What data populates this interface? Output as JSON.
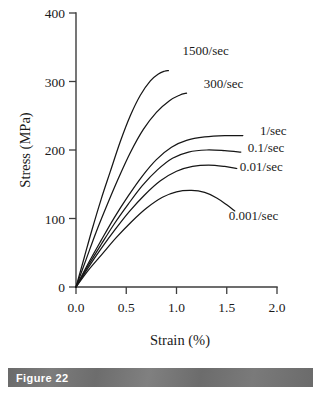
{
  "caption": {
    "label": "Figure 22"
  },
  "chart_data": {
    "type": "line",
    "title": "",
    "xlabel": "Strain (%)",
    "ylabel": "Stress (MPa)",
    "xlim": [
      0.0,
      2.0
    ],
    "ylim": [
      0,
      400
    ],
    "xticks": [
      "0.0",
      "0.5",
      "1.0",
      "1.5",
      "2.0"
    ],
    "xtick_values": [
      0.0,
      0.5,
      1.0,
      1.5,
      2.0
    ],
    "yticks": [
      "0",
      "100",
      "200",
      "300",
      "400"
    ],
    "ytick_values": [
      0,
      100,
      200,
      300,
      400
    ],
    "grid": false,
    "legend_position": "inline-right-of-curve-ends",
    "series": [
      {
        "name": "1500/sec",
        "label": "1500/sec",
        "label_x": 1.06,
        "label_y": 345,
        "x": [
          0.0,
          0.08,
          0.16,
          0.25,
          0.34,
          0.44,
          0.54,
          0.64,
          0.74,
          0.82,
          0.88,
          0.92
        ],
        "y": [
          0,
          42,
          84,
          128,
          168,
          212,
          250,
          280,
          301,
          311,
          315,
          316
        ]
      },
      {
        "name": "300/sec",
        "label": "300/sec",
        "label_x": 1.27,
        "label_y": 297,
        "x": [
          0.0,
          0.1,
          0.2,
          0.31,
          0.42,
          0.54,
          0.67,
          0.8,
          0.93,
          1.03,
          1.1
        ],
        "y": [
          0,
          40,
          80,
          120,
          158,
          196,
          230,
          255,
          272,
          280,
          283
        ]
      },
      {
        "name": "1/sec",
        "label": "1/sec",
        "label_x": 1.83,
        "label_y": 228,
        "x": [
          0.0,
          0.12,
          0.25,
          0.38,
          0.52,
          0.66,
          0.8,
          0.95,
          1.1,
          1.28,
          1.48,
          1.66
        ],
        "y": [
          0,
          34,
          68,
          101,
          133,
          162,
          186,
          204,
          214,
          219,
          221,
          221
        ]
      },
      {
        "name": "0.1/sec",
        "label": "0.1/sec",
        "label_x": 1.71,
        "label_y": 203,
        "x": [
          0.0,
          0.12,
          0.25,
          0.38,
          0.52,
          0.66,
          0.81,
          0.96,
          1.12,
          1.3,
          1.48,
          1.64
        ],
        "y": [
          0,
          31,
          62,
          92,
          121,
          148,
          171,
          188,
          197,
          200,
          199,
          197
        ]
      },
      {
        "name": "0.01/sec",
        "label": "0.01/sec",
        "label_x": 1.63,
        "label_y": 175,
        "x": [
          0.0,
          0.12,
          0.25,
          0.39,
          0.53,
          0.68,
          0.84,
          1.0,
          1.16,
          1.32,
          1.48,
          1.6
        ],
        "y": [
          0,
          28,
          56,
          84,
          110,
          134,
          155,
          169,
          176,
          178,
          176,
          173
        ]
      },
      {
        "name": "0.001/sec",
        "label": "0.001/sec",
        "label_x": 1.52,
        "label_y": 104,
        "x": [
          0.0,
          0.12,
          0.26,
          0.4,
          0.55,
          0.7,
          0.86,
          1.0,
          1.15,
          1.28,
          1.4,
          1.5,
          1.58
        ],
        "y": [
          0,
          24,
          48,
          72,
          95,
          115,
          131,
          139,
          141,
          138,
          130,
          120,
          111
        ]
      }
    ]
  }
}
